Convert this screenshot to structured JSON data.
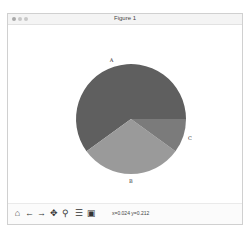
{
  "window": {
    "title": "Figure 1"
  },
  "toolbar": {
    "icons": [
      {
        "name": "home-icon",
        "glyph": "⌂"
      },
      {
        "name": "back-icon",
        "glyph": "←"
      },
      {
        "name": "forward-icon",
        "glyph": "→"
      },
      {
        "name": "pan-icon",
        "glyph": "✥"
      },
      {
        "name": "zoom-icon",
        "glyph": "⚲"
      },
      {
        "name": "configure-subplots-icon",
        "glyph": "☰"
      },
      {
        "name": "save-icon",
        "glyph": "▣"
      }
    ],
    "coords": "x=0.024 y=0.212"
  },
  "chart_data": {
    "type": "pie",
    "title": "",
    "categories": [
      "A",
      "B",
      "C"
    ],
    "values": [
      60,
      30,
      10
    ],
    "colors": [
      "#5f5f5f",
      "#9a9a9a",
      "#7b7b7b"
    ],
    "startangle": 0,
    "counterclock": true,
    "labels_outside": true,
    "legend": "none"
  }
}
